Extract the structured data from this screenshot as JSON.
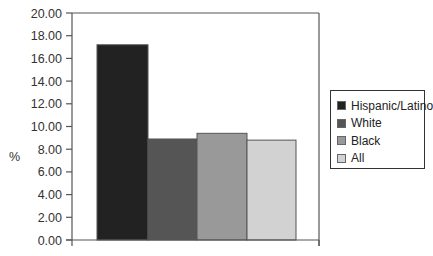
{
  "chart_data": {
    "type": "bar",
    "title": "",
    "xlabel": "",
    "ylabel": "%",
    "ylim": [
      0,
      20
    ],
    "yticks": [
      "0.00",
      "2.00",
      "4.00",
      "6.00",
      "8.00",
      "10.00",
      "12.00",
      "14.00",
      "16.00",
      "18.00",
      "20.00"
    ],
    "categories": [
      "Hispanic/Latino",
      "White",
      "Black",
      "All"
    ],
    "values": [
      17.2,
      8.9,
      9.4,
      8.8
    ],
    "colors": [
      "#222222",
      "#555555",
      "#999999",
      "#d2d2d2"
    ],
    "grid": false,
    "legend_position": "right"
  },
  "legend": {
    "items": [
      {
        "label": "Hispanic/Latino",
        "color": "#222222"
      },
      {
        "label": "White",
        "color": "#555555"
      },
      {
        "label": "Black",
        "color": "#999999"
      },
      {
        "label": "All",
        "color": "#d2d2d2"
      }
    ]
  },
  "axis": {
    "y_title": "%"
  }
}
